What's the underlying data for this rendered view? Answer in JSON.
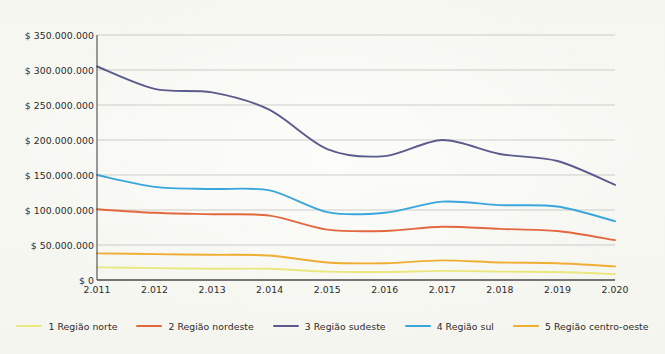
{
  "chart_data": {
    "type": "line",
    "title": "",
    "subtitle": "",
    "xlabel": "",
    "ylabel": "",
    "grid": true,
    "legend_position": "bottom",
    "categories": [
      "2.011",
      "2.012",
      "2.013",
      "2.014",
      "2.015",
      "2.016",
      "2.017",
      "2.018",
      "2.019",
      "2.020"
    ],
    "ylim": [
      0,
      350000000
    ],
    "ytick_step": 50000000,
    "ytick_labels": [
      "$ 350.000.000",
      "$ 300.000.000",
      "$ 250.000.000",
      "$ 200.000.000",
      "$ 150.000.000",
      "$ 100.000.000",
      "$ 50.000.000",
      "$ 0"
    ],
    "ytick_values": [
      350000000,
      300000000,
      250000000,
      200000000,
      150000000,
      100000000,
      50000000,
      0
    ],
    "series": [
      {
        "name": "1 Região norte",
        "color": "#e9e87f",
        "values": [
          18000000,
          17000000,
          16000000,
          16000000,
          12000000,
          11500000,
          13000000,
          12000000,
          11500000,
          8500000
        ]
      },
      {
        "name": "2 Região nordeste",
        "color": "#e2683f",
        "values": [
          101000000,
          96000000,
          94000000,
          92000000,
          72000000,
          70000000,
          76000000,
          73000000,
          70000000,
          57000000
        ]
      },
      {
        "name": "3 Região sudeste",
        "color": "#5b5b8e",
        "values": [
          305000000,
          273000000,
          268000000,
          243000000,
          187000000,
          177000000,
          200000000,
          180000000,
          170000000,
          136000000
        ]
      },
      {
        "name": "4 Região sul",
        "color": "#3aa6dc",
        "values": [
          150000000,
          133000000,
          130000000,
          128000000,
          97000000,
          96000000,
          112000000,
          107000000,
          105000000,
          84000000
        ]
      },
      {
        "name": "5 Região centro-oeste",
        "color": "#f0ad33",
        "values": [
          38000000,
          37000000,
          36000000,
          35000000,
          25000000,
          24000000,
          28000000,
          25000000,
          24000000,
          19500000
        ]
      }
    ]
  },
  "axes": {
    "grid_color": "#b9b9b9",
    "axis_color": "#4a4a4a"
  }
}
